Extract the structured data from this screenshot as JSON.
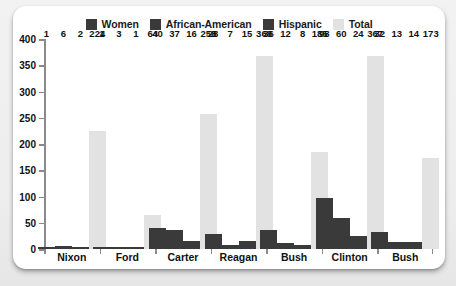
{
  "chart_data": {
    "type": "bar",
    "title": "",
    "subtitle": "",
    "xlabel": "",
    "ylabel": "",
    "ylim": [
      0,
      400
    ],
    "yticks": [
      0,
      50,
      100,
      150,
      200,
      250,
      300,
      350,
      400
    ],
    "grid": false,
    "legend_position": "top-center",
    "categories": [
      "Nixon",
      "Ford",
      "Carter",
      "Reagan",
      "Bush",
      "Clinton",
      "Bush"
    ],
    "series": [
      {
        "name": "Women",
        "color": "#3a3a3a",
        "values": [
          1,
          1,
          40,
          28,
          36,
          98,
          32
        ]
      },
      {
        "name": "African-American",
        "color": "#3a3a3a",
        "values": [
          6,
          3,
          37,
          7,
          12,
          60,
          13
        ]
      },
      {
        "name": "Hispanic",
        "color": "#3a3a3a",
        "values": [
          2,
          1,
          16,
          15,
          8,
          24,
          14
        ]
      },
      {
        "name": "Total",
        "color": "#e2e2e2",
        "values": [
          224,
          64,
          258,
          368,
          185,
          367,
          173
        ]
      }
    ]
  },
  "legend": {
    "items": [
      {
        "label": "Women",
        "color": "#3a3a3a"
      },
      {
        "label": "African-American",
        "color": "#3a3a3a"
      },
      {
        "label": "Hispanic",
        "color": "#3a3a3a"
      },
      {
        "label": "Total",
        "color": "#e2e2e2"
      }
    ]
  },
  "colors": {
    "card_background": "#ffffff",
    "page_background": "#eeeeee",
    "axis": "#8a8a8a",
    "text": "#111111",
    "dark_bar": "#3a3a3a",
    "total_bar": "#e2e2e2"
  }
}
